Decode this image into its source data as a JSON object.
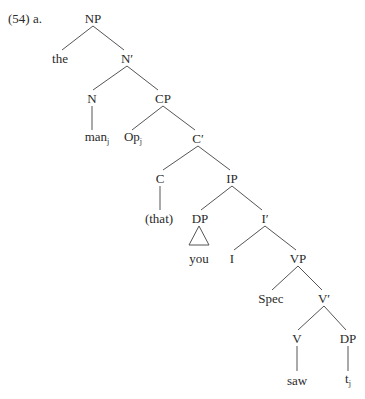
{
  "example_label": "(54)  a.",
  "colors": {
    "text": "#2a2a2a",
    "line": "#555555",
    "background": "#ffffff"
  },
  "nodes": [
    {
      "id": "np",
      "label": "NP",
      "sub": "",
      "x": 93,
      "y": 18
    },
    {
      "id": "the",
      "label": "the",
      "sub": "",
      "x": 60,
      "y": 58
    },
    {
      "id": "nbar",
      "label": "N′",
      "sub": "",
      "x": 127,
      "y": 58
    },
    {
      "id": "n",
      "label": "N",
      "sub": "",
      "x": 92,
      "y": 98
    },
    {
      "id": "cp",
      "label": "CP",
      "sub": "",
      "x": 163,
      "y": 98
    },
    {
      "id": "man",
      "label": "man",
      "sub": "j",
      "x": 97,
      "y": 138
    },
    {
      "id": "op",
      "label": "Op",
      "sub": "j",
      "x": 133,
      "y": 138
    },
    {
      "id": "cbar",
      "label": "C′",
      "sub": "",
      "x": 198,
      "y": 138
    },
    {
      "id": "c",
      "label": "C",
      "sub": "",
      "x": 160,
      "y": 178
    },
    {
      "id": "ip",
      "label": "IP",
      "sub": "",
      "x": 232,
      "y": 178
    },
    {
      "id": "that",
      "label": "(that)",
      "sub": "",
      "x": 159,
      "y": 218
    },
    {
      "id": "dp1",
      "label": "DP",
      "sub": "",
      "x": 200,
      "y": 218
    },
    {
      "id": "ibar",
      "label": "I′",
      "sub": "",
      "x": 265,
      "y": 218
    },
    {
      "id": "you",
      "label": "you",
      "sub": "",
      "x": 199,
      "y": 258
    },
    {
      "id": "i",
      "label": "I",
      "sub": "",
      "x": 232,
      "y": 258
    },
    {
      "id": "vp",
      "label": "VP",
      "sub": "",
      "x": 298,
      "y": 258
    },
    {
      "id": "spec",
      "label": "Spec",
      "sub": "",
      "x": 271,
      "y": 298
    },
    {
      "id": "vbar",
      "label": "V′",
      "sub": "",
      "x": 324,
      "y": 298
    },
    {
      "id": "v",
      "label": "V",
      "sub": "",
      "x": 297,
      "y": 338
    },
    {
      "id": "dp2",
      "label": "DP",
      "sub": "",
      "x": 348,
      "y": 338
    },
    {
      "id": "saw",
      "label": "saw",
      "sub": "",
      "x": 297,
      "y": 380
    },
    {
      "id": "t",
      "label": "t",
      "sub": "j",
      "x": 348,
      "y": 380
    }
  ],
  "edges": [
    [
      93,
      26,
      62,
      50
    ],
    [
      93,
      26,
      124,
      50
    ],
    [
      127,
      66,
      93,
      90
    ],
    [
      127,
      66,
      158,
      90
    ],
    [
      92,
      106,
      92,
      130
    ],
    [
      163,
      106,
      132,
      130
    ],
    [
      163,
      106,
      195,
      130
    ],
    [
      198,
      146,
      163,
      170
    ],
    [
      198,
      146,
      230,
      170
    ],
    [
      160,
      186,
      160,
      210
    ],
    [
      232,
      186,
      201,
      210
    ],
    [
      232,
      186,
      262,
      210
    ],
    [
      265,
      226,
      234,
      250
    ],
    [
      265,
      226,
      296,
      250
    ],
    [
      298,
      266,
      272,
      290
    ],
    [
      298,
      266,
      322,
      290
    ],
    [
      324,
      306,
      298,
      330
    ],
    [
      324,
      306,
      346,
      330
    ],
    [
      297,
      346,
      297,
      371
    ],
    [
      348,
      346,
      348,
      371
    ]
  ],
  "triangles": [
    {
      "points": "199,226 189,245 209,245"
    }
  ]
}
